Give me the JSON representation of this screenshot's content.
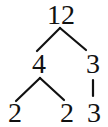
{
  "diagram": {
    "type": "factor-tree",
    "root": "12",
    "nodes": [
      {
        "id": "n12",
        "label": "12",
        "x": 61,
        "y": 1
      },
      {
        "id": "n4",
        "label": "4",
        "x": 39,
        "y": 50
      },
      {
        "id": "n3a",
        "label": "3",
        "x": 93,
        "y": 50
      },
      {
        "id": "n2a",
        "label": "2",
        "x": 15,
        "y": 99
      },
      {
        "id": "n2b",
        "label": "2",
        "x": 67,
        "y": 99
      },
      {
        "id": "n3b",
        "label": "3",
        "x": 94,
        "y": 99
      }
    ],
    "edges": [
      {
        "from": "n12",
        "to": "n4"
      },
      {
        "from": "n12",
        "to": "n3a"
      },
      {
        "from": "n4",
        "to": "n2a"
      },
      {
        "from": "n4",
        "to": "n2b"
      },
      {
        "from": "n3a",
        "to": "n3b"
      }
    ],
    "labels": {
      "root": "12",
      "left_child": "4",
      "right_child": "3",
      "leaf_1": "2",
      "leaf_2": "2",
      "leaf_3": "3"
    }
  }
}
